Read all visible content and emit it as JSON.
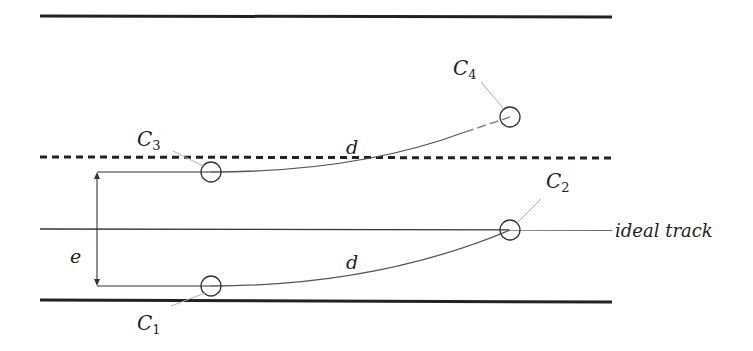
{
  "diagram": {
    "colors": {
      "stroke": "#222222",
      "leader": "#b0b0b0",
      "curve": "#555555",
      "background": "#ffffff"
    },
    "boundaries": {
      "top_rail": {
        "x1": 40,
        "x2": 612,
        "y": 16
      },
      "dashed_limit": {
        "x1": 40,
        "x2": 612,
        "y": 157
      },
      "ideal_track": {
        "x1": 40,
        "x2": 612,
        "y": 229
      },
      "bottom_rail": {
        "x1": 40,
        "x2": 612,
        "y": 301
      }
    },
    "labels": {
      "ideal_track": "ideal track",
      "e": "e",
      "d_upper": "d",
      "d_lower": "d",
      "C1": {
        "letter": "C",
        "sub": "1"
      },
      "C2": {
        "letter": "C",
        "sub": "2"
      },
      "C3": {
        "letter": "C",
        "sub": "3"
      },
      "C4": {
        "letter": "C",
        "sub": "4"
      }
    },
    "circles": [
      {
        "id": "C1",
        "cx": 211,
        "cy": 286,
        "r": 10
      },
      {
        "id": "C2",
        "cx": 510,
        "cy": 230,
        "r": 10
      },
      {
        "id": "C3",
        "cx": 211,
        "cy": 172,
        "r": 10
      },
      {
        "id": "C4",
        "cx": 510,
        "cy": 117,
        "r": 10
      }
    ],
    "dimension_e": {
      "x": 97,
      "y_top": 172,
      "y_bottom": 285
    }
  }
}
